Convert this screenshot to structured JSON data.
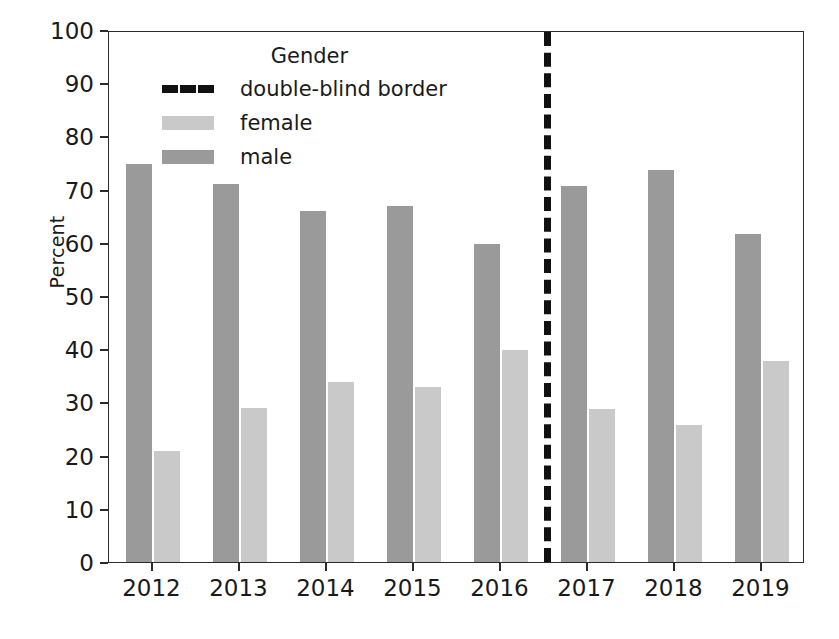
{
  "chart_data": {
    "type": "bar",
    "title": "",
    "xlabel": "",
    "ylabel": "Percent",
    "categories": [
      "2012",
      "2013",
      "2014",
      "2015",
      "2016",
      "2017",
      "2018",
      "2019"
    ],
    "series": [
      {
        "name": "male",
        "values": [
          74.8,
          71.0,
          65.9,
          66.9,
          59.8,
          70.7,
          73.7,
          61.7
        ]
      },
      {
        "name": "female",
        "values": [
          20.9,
          28.9,
          33.9,
          32.9,
          39.9,
          28.7,
          25.7,
          37.8
        ]
      }
    ],
    "ylim": [
      0,
      100
    ],
    "yticks": [
      0,
      10,
      20,
      30,
      40,
      50,
      60,
      70,
      80,
      90,
      100
    ],
    "ytick_labels": [
      "0",
      "10",
      "20",
      "30",
      "40",
      "50",
      "60",
      "70",
      "80",
      "90",
      "100"
    ],
    "grid": false,
    "legend": {
      "position": "upper center",
      "title": "Gender",
      "entries": [
        {
          "label": "double-blind border",
          "color": "#111111",
          "style": "dashed-line"
        },
        {
          "label": "female",
          "color": "#c9c9c9",
          "style": "patch"
        },
        {
          "label": "male",
          "color": "#9a9a9a",
          "style": "patch"
        }
      ]
    },
    "annotations": [
      {
        "name": "double-blind border",
        "type": "vline",
        "x": "between 2016 and 2017",
        "style": "black dashed",
        "linewidth": 7
      }
    ],
    "colors": {
      "male": "#9a9a9a",
      "female": "#c9c9c9",
      "divider": "#111111",
      "axis": "#2b2b2b",
      "text": "#1a1a1a",
      "background": "#ffffff"
    }
  }
}
